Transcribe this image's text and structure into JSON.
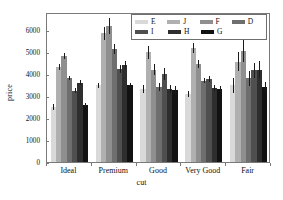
{
  "chart_data": {
    "type": "bar",
    "title": "",
    "xlabel": "cut",
    "ylabel": "price",
    "categories": [
      "Ideal",
      "Premium",
      "Good",
      "Very Good",
      "Fair"
    ],
    "ylim": [
      0,
      6800
    ],
    "yticks": [
      0,
      1000,
      2000,
      3000,
      4000,
      5000,
      6000
    ],
    "grid": false,
    "legend_position": "top-right",
    "legend_rows": [
      [
        "E",
        "J",
        "F",
        "D"
      ],
      [
        "I",
        "H",
        "G"
      ]
    ],
    "error_bars": true,
    "series": [
      {
        "name": "E",
        "color": "#d9d9d9",
        "values": [
          2600,
          3560,
          3390,
          3190,
          3560
        ],
        "errors": [
          140,
          120,
          190,
          140,
          330
        ]
      },
      {
        "name": "J",
        "color": "#b0b0b0",
        "values": [
          4400,
          5920,
          5060,
          5260,
          4640
        ],
        "errors": [
          150,
          300,
          300,
          230,
          420
        ]
      },
      {
        "name": "F",
        "color": "#8f8f8f",
        "values": [
          4900,
          6260,
          4280,
          4530,
          5130
        ],
        "errors": [
          140,
          360,
          250,
          180,
          500
        ]
      },
      {
        "name": "D",
        "color": "#6e6e6e",
        "values": [
          3900,
          5200,
          3500,
          3780,
          3880
        ],
        "errors": [
          110,
          230,
          190,
          130,
          330
        ]
      },
      {
        "name": "I",
        "color": "#4f4f4f",
        "values": [
          3330,
          4320,
          4080,
          3860,
          4240
        ],
        "errors": [
          130,
          180,
          260,
          150,
          340
        ]
      },
      {
        "name": "H",
        "color": "#2e2e2e",
        "values": [
          3690,
          4470,
          3400,
          3460,
          4270
        ],
        "errors": [
          110,
          180,
          200,
          130,
          390
        ]
      },
      {
        "name": "G",
        "color": "#121212",
        "values": [
          2660,
          3570,
          3350,
          3400,
          3480
        ],
        "errors": [
          100,
          110,
          170,
          120,
          230
        ]
      }
    ]
  }
}
